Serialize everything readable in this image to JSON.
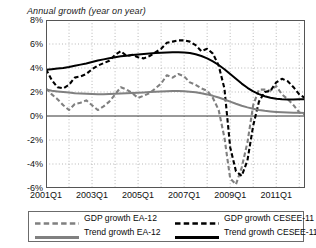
{
  "chart_data": {
    "type": "line",
    "title": "",
    "subtitle": "Annual growth (year on year)",
    "xlabel": "",
    "ylabel": "",
    "ylim": [
      -6,
      8
    ],
    "yticks": [
      "8%",
      "6%",
      "4%",
      "2%",
      "0%",
      "-2%",
      "-4%",
      "-6%"
    ],
    "ytick_values": [
      8,
      6,
      4,
      2,
      0,
      -2,
      -4,
      -6
    ],
    "xticks": [
      "2001Q1",
      "2003Q1",
      "2005Q1",
      "2007Q1",
      "2009Q1",
      "2011Q1"
    ],
    "xtick_values": [
      2001.0,
      2003.0,
      2005.0,
      2007.0,
      2009.0,
      2011.0
    ],
    "xlim": [
      2001.0,
      2012.25
    ],
    "grid": "dotted-both",
    "legend_position": "below-plot",
    "zero_line": 0,
    "colors": {
      "cesee": "#000000",
      "ea": "#808080",
      "grid": "#b8b8b8",
      "axis": "#555555"
    },
    "x": [
      2001.0,
      2001.25,
      2001.5,
      2001.75,
      2002.0,
      2002.25,
      2002.5,
      2002.75,
      2003.0,
      2003.25,
      2003.5,
      2003.75,
      2004.0,
      2004.25,
      2004.5,
      2004.75,
      2005.0,
      2005.25,
      2005.5,
      2005.75,
      2006.0,
      2006.25,
      2006.5,
      2006.75,
      2007.0,
      2007.25,
      2007.5,
      2007.75,
      2008.0,
      2008.25,
      2008.5,
      2008.75,
      2009.0,
      2009.25,
      2009.5,
      2009.75,
      2010.0,
      2010.25,
      2010.5,
      2010.75,
      2011.0,
      2011.25,
      2011.5,
      2011.75,
      2012.0,
      2012.25
    ],
    "series": [
      {
        "name": "GDP growth EA-12",
        "style": "dashed",
        "color": "#808080",
        "values": [
          2.3,
          1.8,
          1.4,
          0.9,
          0.5,
          1.0,
          1.1,
          1.3,
          0.9,
          0.5,
          0.8,
          1.2,
          1.8,
          2.4,
          2.2,
          1.9,
          1.5,
          1.7,
          1.9,
          2.3,
          2.7,
          3.4,
          3.2,
          3.5,
          3.3,
          2.8,
          2.6,
          2.3,
          2.1,
          1.5,
          0.5,
          -1.8,
          -5.2,
          -5.7,
          -4.3,
          -2.2,
          0.9,
          2.2,
          2.2,
          2.1,
          2.5,
          1.8,
          1.4,
          0.9,
          0.3,
          0.1
        ]
      },
      {
        "name": "GDP growth CESEE-11",
        "style": "dashed",
        "color": "#000000",
        "values": [
          3.9,
          3.0,
          2.4,
          2.3,
          2.6,
          3.2,
          3.3,
          3.5,
          3.9,
          4.2,
          4.4,
          4.6,
          5.1,
          5.4,
          5.0,
          5.1,
          4.9,
          4.8,
          5.0,
          5.3,
          5.6,
          6.1,
          6.2,
          6.3,
          6.3,
          6.2,
          5.9,
          5.4,
          5.6,
          5.2,
          4.2,
          2.3,
          -2.6,
          -4.6,
          -5.0,
          -3.7,
          -0.8,
          1.2,
          2.0,
          2.1,
          2.8,
          3.1,
          2.9,
          2.4,
          1.8,
          1.5
        ]
      },
      {
        "name": "Trend growth EA-12",
        "style": "solid",
        "color": "#808080",
        "values": [
          2.2,
          2.1,
          2.05,
          2.0,
          1.95,
          1.9,
          1.88,
          1.85,
          1.83,
          1.82,
          1.82,
          1.83,
          1.85,
          1.88,
          1.9,
          1.92,
          1.94,
          1.96,
          1.99,
          2.02,
          2.05,
          2.07,
          2.08,
          2.08,
          2.06,
          2.03,
          1.98,
          1.9,
          1.8,
          1.68,
          1.54,
          1.38,
          1.2,
          1.02,
          0.86,
          0.72,
          0.6,
          0.5,
          0.43,
          0.38,
          0.34,
          0.31,
          0.29,
          0.28,
          0.27,
          0.26
        ]
      },
      {
        "name": "Trend growth CESEE-11",
        "style": "solid",
        "color": "#000000",
        "values": [
          3.85,
          3.9,
          3.95,
          4.0,
          4.08,
          4.18,
          4.28,
          4.38,
          4.5,
          4.62,
          4.72,
          4.82,
          4.9,
          4.97,
          5.03,
          5.08,
          5.12,
          5.16,
          5.2,
          5.24,
          5.27,
          5.3,
          5.32,
          5.32,
          5.3,
          5.25,
          5.15,
          5.0,
          4.8,
          4.55,
          4.25,
          3.9,
          3.5,
          3.1,
          2.7,
          2.35,
          2.05,
          1.82,
          1.65,
          1.52,
          1.44,
          1.4,
          1.38,
          1.38,
          1.39,
          1.4
        ]
      }
    ]
  },
  "legend": {
    "entries": [
      {
        "label": "GDP growth EA-12",
        "style": "dashed",
        "color": "#808080"
      },
      {
        "label": "GDP growth CESEE-11",
        "style": "dashed",
        "color": "#000000"
      },
      {
        "label": "Trend growth EA-12",
        "style": "solid",
        "color": "#808080"
      },
      {
        "label": "Trend growth CESEE-11",
        "style": "solid",
        "color": "#000000"
      }
    ]
  }
}
